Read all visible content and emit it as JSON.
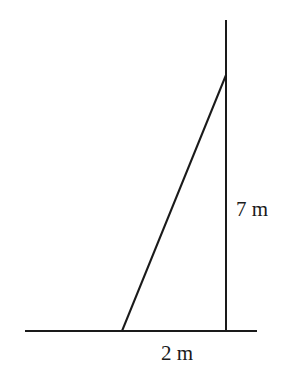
{
  "diagram": {
    "type": "right-triangle-ladder-wall",
    "labels": {
      "height": "7 m",
      "base": "2 m"
    },
    "colors": {
      "stroke": "#1a1a1a",
      "background": "#ffffff"
    },
    "geometry": {
      "ground": {
        "x1": 25,
        "y1": 331,
        "x2": 257,
        "y2": 331
      },
      "wall": {
        "x1": 226,
        "y1": 20,
        "x2": 226,
        "y2": 331
      },
      "ladder": {
        "x1": 122,
        "y1": 331,
        "x2": 226,
        "y2": 75
      }
    }
  }
}
